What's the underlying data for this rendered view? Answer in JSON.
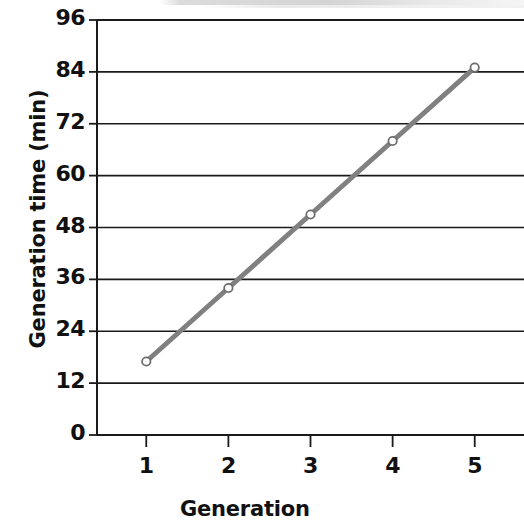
{
  "chart_data": {
    "type": "line",
    "title": "",
    "xlabel": "Generation",
    "ylabel": "Generation time (min)",
    "x": [
      1,
      2,
      3,
      4,
      5
    ],
    "categories": [
      "1",
      "2",
      "3",
      "4",
      "5"
    ],
    "series": [
      {
        "name": "Generation time",
        "values": [
          17,
          34,
          51,
          68,
          85
        ],
        "color": "#808080",
        "marker": "open-circle"
      }
    ],
    "xlim": [
      0.4,
      5.6
    ],
    "ylim": [
      0,
      96
    ],
    "xticks": [
      1,
      2,
      3,
      4,
      5
    ],
    "yticks": [
      0,
      12,
      24,
      36,
      48,
      60,
      72,
      84,
      96
    ],
    "xtick_labels": [
      "1",
      "2",
      "3",
      "4",
      "5"
    ],
    "ytick_labels": [
      "0",
      "12",
      "24",
      "36",
      "48",
      "60",
      "72",
      "84",
      "96"
    ],
    "grid": {
      "horizontal": true,
      "vertical": false,
      "color": "#1a1a1a"
    },
    "legend": {
      "visible": false,
      "position": "none"
    }
  },
  "axes": {
    "y_ticks": [
      {
        "label": "96",
        "value": 96
      },
      {
        "label": "84",
        "value": 84
      },
      {
        "label": "72",
        "value": 72
      },
      {
        "label": "60",
        "value": 60
      },
      {
        "label": "48",
        "value": 48
      },
      {
        "label": "36",
        "value": 36
      },
      {
        "label": "24",
        "value": 24
      },
      {
        "label": "12",
        "value": 12
      },
      {
        "label": "0",
        "value": 0
      }
    ],
    "x_ticks": [
      {
        "label": "1",
        "value": 1
      },
      {
        "label": "2",
        "value": 2
      },
      {
        "label": "3",
        "value": 3
      },
      {
        "label": "4",
        "value": 4
      },
      {
        "label": "5",
        "value": 5
      }
    ]
  },
  "colors": {
    "line": "#808080",
    "marker_fill": "#ffffff",
    "marker_stroke": "#6e6e6e",
    "axis": "#1a1a1a",
    "grid": "#1a1a1a",
    "text": "#111111",
    "background": "#ffffff"
  }
}
